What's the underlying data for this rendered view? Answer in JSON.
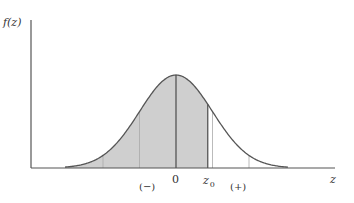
{
  "figure": {
    "type": "normal-distribution-diagram",
    "y_axis_label": "f(z)",
    "x_axis_label": "z",
    "labels": {
      "zero": "0",
      "z0_base": "z",
      "z0_sub": "0",
      "negative": "(−)",
      "positive": "(+)"
    },
    "colors": {
      "axis": "#555555",
      "curve": "#555555",
      "shade": "#cfcfcf",
      "background": "#ffffff"
    },
    "shaded_region": "from left tail to z0",
    "z0_value_sigma": 0.87,
    "gridlines_sigma": [
      -2,
      -1,
      0,
      0.87,
      1,
      2
    ]
  }
}
